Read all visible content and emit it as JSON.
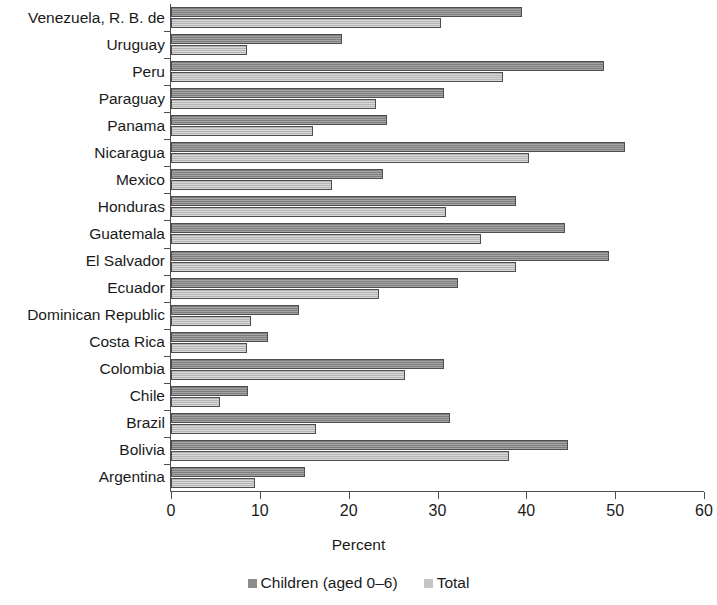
{
  "chart_data": {
    "type": "bar",
    "orientation": "horizontal",
    "title": "",
    "xlabel": "Percent",
    "ylabel": "",
    "xlim": [
      0,
      60
    ],
    "xticks": [
      0,
      10,
      20,
      30,
      40,
      50,
      60
    ],
    "grid": false,
    "legend_position": "bottom",
    "categories": [
      "Venezuela, R. B. de",
      "Uruguay",
      "Peru",
      "Paraguay",
      "Panama",
      "Nicaragua",
      "Mexico",
      "Honduras",
      "Guatemala",
      "El Salvador",
      "Ecuador",
      "Dominican Republic",
      "Costa Rica",
      "Colombia",
      "Chile",
      "Brazil",
      "Bolivia",
      "Argentina"
    ],
    "series": [
      {
        "name": "Children (aged 0–6)",
        "color": "#8c8c8c",
        "values": [
          39.5,
          19.2,
          48.7,
          30.7,
          24.3,
          51.1,
          23.9,
          38.8,
          44.4,
          49.3,
          32.3,
          14.4,
          10.9,
          30.7,
          8.7,
          31.4,
          44.7,
          15.1
        ]
      },
      {
        "name": "Total",
        "color": "#c4c4c4",
        "values": [
          30.4,
          8.6,
          37.4,
          23.1,
          16.0,
          40.3,
          18.1,
          31.0,
          34.9,
          38.8,
          23.4,
          9.0,
          8.6,
          26.3,
          5.5,
          16.3,
          38.1,
          9.5
        ]
      }
    ]
  },
  "legend": {
    "items": [
      {
        "label": "Children (aged 0–6)",
        "swatch": "children"
      },
      {
        "label": "Total",
        "swatch": "total"
      }
    ]
  }
}
